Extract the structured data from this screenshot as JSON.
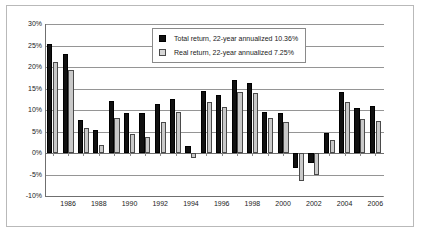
{
  "chart_data": {
    "type": "bar",
    "title": "",
    "subtitle": "",
    "xlabel": "",
    "ylabel": "",
    "ylim": [
      -10,
      30
    ],
    "ytick_step": 5,
    "ytick_labels": [
      "30%",
      "25%",
      "20%",
      "15%",
      "10%",
      "5%",
      "0%",
      "-5%",
      "-10%"
    ],
    "ytick_values": [
      30,
      25,
      20,
      15,
      10,
      5,
      0,
      -5,
      -10
    ],
    "grid": true,
    "legend_position": "upper-center-inside",
    "categories": [
      1985,
      1986,
      1987,
      1988,
      1989,
      1990,
      1991,
      1992,
      1993,
      1994,
      1995,
      1996,
      1997,
      1998,
      1999,
      2000,
      2001,
      2002,
      2003,
      2004,
      2005,
      2006
    ],
    "xtick_labels": [
      "1986",
      "1988",
      "1990",
      "1992",
      "1994",
      "1996",
      "1998",
      "2000",
      "2002",
      "2004",
      "2006"
    ],
    "xtick_categories": [
      1986,
      1988,
      1990,
      1992,
      1994,
      1996,
      1998,
      2000,
      2002,
      2004,
      2006
    ],
    "series": [
      {
        "name": "Total return, 22-year annualized 10.36%",
        "short_name": "Total return",
        "color": "#111111",
        "values": [
          25.4,
          23.1,
          7.6,
          5.3,
          12.1,
          9.3,
          9.2,
          11.4,
          12.6,
          1.6,
          14.4,
          13.4,
          17.0,
          16.2,
          9.6,
          9.2,
          -3.4,
          -2.3,
          4.6,
          14.3,
          10.4,
          11.0
        ]
      },
      {
        "name": "Real return, 22-year annualized 7.25%",
        "short_name": "Real return",
        "color": "#c9c9c9",
        "values": [
          21.2,
          19.3,
          5.8,
          1.9,
          8.1,
          4.4,
          3.7,
          7.3,
          9.6,
          -1.1,
          11.9,
          10.6,
          14.2,
          14.0,
          8.1,
          7.1,
          -6.5,
          -5.0,
          3.0,
          11.9,
          7.9,
          7.4
        ]
      }
    ],
    "annotations": []
  },
  "legend": {
    "items": [
      {
        "label": "Total return, 22-year annualized 10.36%",
        "swatch": "black-square-icon"
      },
      {
        "label": "Real return, 22-year annualized 7.25%",
        "swatch": "gray-square-icon"
      }
    ]
  }
}
